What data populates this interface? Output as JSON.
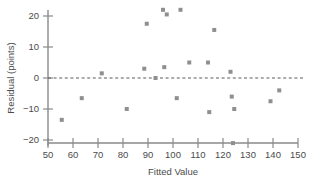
{
  "chart_data": {
    "type": "scatter",
    "title": "",
    "xlabel": "Fitted Value",
    "ylabel": "Residual (points)",
    "xlim": [
      50,
      150
    ],
    "ylim": [
      -22,
      23
    ],
    "xticks": [
      50,
      60,
      70,
      80,
      90,
      100,
      110,
      120,
      130,
      140,
      150
    ],
    "yticks": [
      -20,
      -10,
      0,
      10,
      20
    ],
    "xtick_labels": [
      "50",
      "60",
      "70",
      "80",
      "90",
      "100",
      "110",
      "120",
      "130",
      "140",
      "150"
    ],
    "ytick_labels": [
      "20",
      "10",
      "0",
      "-10",
      "-20"
    ],
    "grid": false,
    "legend": null,
    "reference_line": {
      "type": "horizontal",
      "y": 0,
      "style": "dashed"
    },
    "marker": {
      "shape": "square",
      "color": "#8f8f8f",
      "size": 4
    },
    "points": [
      {
        "x": 55.5,
        "y": -13.5
      },
      {
        "x": 63.5,
        "y": -6.5
      },
      {
        "x": 71.5,
        "y": 1.5
      },
      {
        "x": 81.5,
        "y": -10.0
      },
      {
        "x": 88.5,
        "y": 3.0
      },
      {
        "x": 89.5,
        "y": 17.5
      },
      {
        "x": 93.0,
        "y": 0.0
      },
      {
        "x": 96.0,
        "y": 22.0
      },
      {
        "x": 96.5,
        "y": 3.5
      },
      {
        "x": 97.5,
        "y": 20.5
      },
      {
        "x": 101.5,
        "y": -6.5
      },
      {
        "x": 103.0,
        "y": 22.0
      },
      {
        "x": 106.5,
        "y": 5.0
      },
      {
        "x": 114.0,
        "y": 5.0
      },
      {
        "x": 114.5,
        "y": -11.0
      },
      {
        "x": 116.5,
        "y": 15.5
      },
      {
        "x": 123.0,
        "y": 2.0
      },
      {
        "x": 123.5,
        "y": -6.0
      },
      {
        "x": 124.0,
        "y": -21.0
      },
      {
        "x": 124.5,
        "y": -10.0
      },
      {
        "x": 139.0,
        "y": -7.5
      },
      {
        "x": 142.5,
        "y": -4.0
      }
    ]
  },
  "axes": {
    "x_title": "Fitted Value",
    "y_title": "Residual (points)"
  }
}
